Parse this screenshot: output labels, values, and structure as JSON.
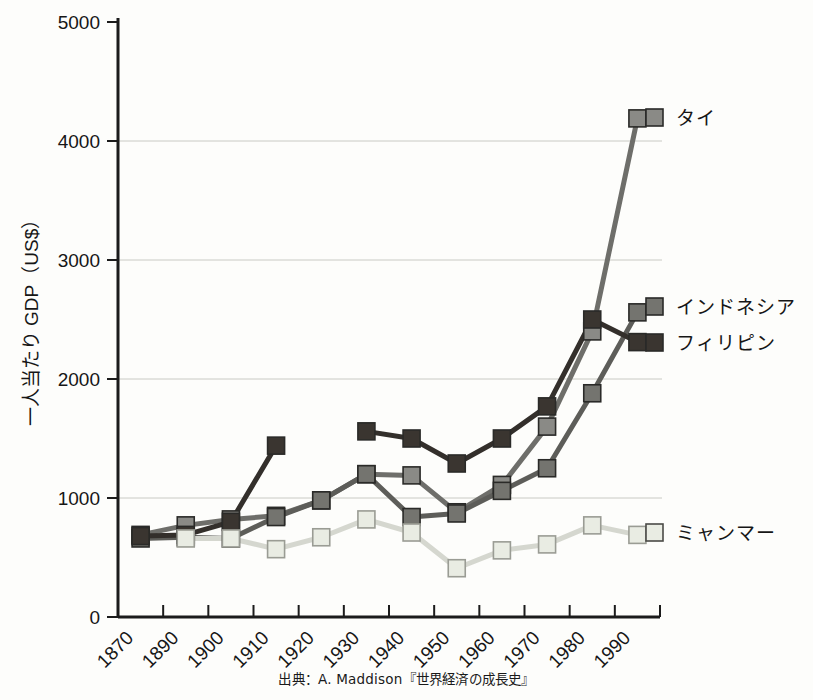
{
  "figure": {
    "source_note": "出典：A. Maddison『世界経済の成長史』",
    "y_axis_title": "一人当たり GDP（US$）"
  },
  "chart_data": {
    "type": "line",
    "title": "",
    "xlabel": "",
    "ylabel": "一人当たり GDP（US$）",
    "ylim": [
      0,
      5000
    ],
    "ytick_values": [
      0,
      1000,
      2000,
      3000,
      4000,
      5000
    ],
    "ytick_labels": [
      "0",
      "1000",
      "2000",
      "3000",
      "4000",
      "5000"
    ],
    "categories": [
      "1870",
      "1890",
      "1900",
      "1910",
      "1920",
      "1930",
      "1940",
      "1950",
      "1960",
      "1970",
      "1980",
      "1990"
    ],
    "grid": "horizontal",
    "legend_position": "right-inline",
    "marker": "square",
    "series": [
      {
        "name": "タイ",
        "color": "#6e6e6a",
        "marker_fill": "#8a8a86",
        "label_x": 676,
        "label_y": 118,
        "values": [
          690,
          770,
          820,
          850,
          980,
          1200,
          1190,
          880,
          1110,
          1600,
          2400,
          4190
        ]
      },
      {
        "name": "インドネシア",
        "color": "#5d5d59",
        "marker_fill": "#74746f",
        "label_x": 676,
        "label_y": 307,
        "values": [
          660,
          670,
          660,
          840,
          980,
          1200,
          840,
          870,
          1060,
          1250,
          1880,
          2560
        ]
      },
      {
        "name": "フィリピン",
        "color": "#332f2b",
        "marker_fill": "#3a3530",
        "label_x": 676,
        "label_y": 343,
        "values": [
          680,
          690,
          800,
          1440,
          null,
          1560,
          1500,
          1290,
          1500,
          1770,
          2500,
          2310
        ]
      },
      {
        "name": "ミャンマー",
        "color": "#d5d7cf",
        "marker_fill": "#e9ece3",
        "label_x": 676,
        "label_y": 533,
        "values": [
          null,
          660,
          660,
          570,
          670,
          820,
          710,
          410,
          560,
          610,
          770,
          690
        ]
      }
    ]
  }
}
